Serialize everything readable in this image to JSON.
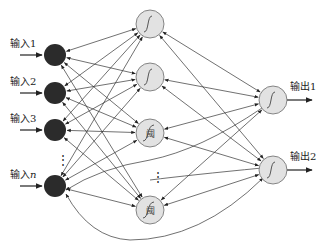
{
  "diagram": {
    "type": "neural-network",
    "inputs": [
      {
        "label": "输入1",
        "x": 55,
        "y": 55
      },
      {
        "label": "输入2",
        "x": 55,
        "y": 93
      },
      {
        "label": "输入3",
        "x": 55,
        "y": 130
      },
      {
        "label": "输入n",
        "x": 55,
        "y": 186
      }
    ],
    "input_ellipsis": "⋮",
    "hidden": [
      {
        "glyph": "sigmoid",
        "x": 150,
        "y": 24
      },
      {
        "glyph": "sigmoid",
        "x": 150,
        "y": 77
      },
      {
        "glyph": "阈",
        "x": 150,
        "y": 133
      },
      {
        "glyph": "阈",
        "x": 150,
        "y": 210
      }
    ],
    "hidden_ellipsis": "⋮",
    "outputs": [
      {
        "label": "输出1",
        "x": 273,
        "y": 100
      },
      {
        "label": "输出2",
        "x": 273,
        "y": 170
      }
    ],
    "colors": {
      "input_fill": "#2b2b2b",
      "node_fill": "#e2e2e2",
      "node_stroke": "#6a6a6a",
      "edge": "#333333"
    }
  }
}
